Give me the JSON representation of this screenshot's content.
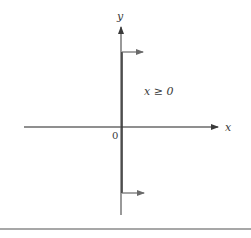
{
  "diagram": {
    "axes": {
      "x_label": "x",
      "y_label": "y",
      "origin_label": "0"
    },
    "region": {
      "condition_label": "x ≥ 0",
      "description": "Half-plane to the right of the y-axis, indicated by arrows pointing right from the y-axis"
    },
    "geometry": {
      "origin": [
        121,
        127
      ],
      "x_axis": {
        "x_start": 24,
        "x_end": 218,
        "y": 127
      },
      "y_axis": {
        "x": 121,
        "y_top": 27,
        "y_bottom": 215
      },
      "boundary_line": {
        "x": 122,
        "y_top": 52,
        "y_bottom": 193
      },
      "region_arrows": [
        {
          "y": 52,
          "x_start": 122,
          "x_end": 143
        },
        {
          "y": 193,
          "x_start": 122,
          "x_end": 144
        }
      ],
      "bottom_rule_y": 229
    },
    "colors": {
      "axis": "#555555",
      "boundary": "#3a3a3a",
      "arrow": "#6a6a6a",
      "rule": "#8a8a8a",
      "text": "#3a3a3a"
    }
  }
}
